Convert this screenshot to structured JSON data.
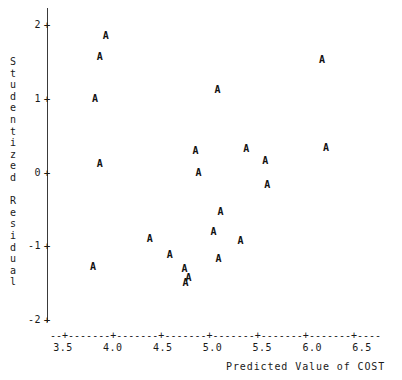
{
  "chart_data": {
    "type": "scatter",
    "title": "",
    "xlabel": "Predicted Value of COST",
    "ylabel": "Studentized Residual",
    "marker_symbol": "A",
    "xlim": [
      3.4,
      6.8
    ],
    "ylim": [
      -2,
      2.15
    ],
    "xticks": [
      3.5,
      4.0,
      4.5,
      5.0,
      5.5,
      6.0,
      6.5
    ],
    "xticklabels": [
      "3.5",
      "4.0",
      "4.5",
      "5.0",
      "5.5",
      "6.0",
      "6.5"
    ],
    "yticks": [
      2,
      1,
      0,
      -1,
      -2
    ],
    "yticklabels": [
      "2",
      "1",
      "0",
      "-1",
      "-2"
    ],
    "grid": false,
    "legend": null,
    "axis_style": "dashed-x-solid-y",
    "points": [
      {
        "x": 3.93,
        "y": 1.85
      },
      {
        "x": 3.87,
        "y": 1.56
      },
      {
        "x": 3.82,
        "y": 0.99
      },
      {
        "x": 3.87,
        "y": 0.11
      },
      {
        "x": 3.8,
        "y": -1.28
      },
      {
        "x": 4.37,
        "y": -0.9
      },
      {
        "x": 4.57,
        "y": -1.12
      },
      {
        "x": 4.72,
        "y": -1.31
      },
      {
        "x": 4.73,
        "y": -1.5
      },
      {
        "x": 4.76,
        "y": -1.43
      },
      {
        "x": 4.83,
        "y": 0.29
      },
      {
        "x": 4.86,
        "y": -0.01
      },
      {
        "x": 5.05,
        "y": 1.12
      },
      {
        "x": 5.01,
        "y": -0.8
      },
      {
        "x": 5.06,
        "y": -1.17
      },
      {
        "x": 5.08,
        "y": -0.54
      },
      {
        "x": 5.28,
        "y": -0.93
      },
      {
        "x": 5.34,
        "y": 0.32
      },
      {
        "x": 5.53,
        "y": 0.16
      },
      {
        "x": 5.55,
        "y": -0.17
      },
      {
        "x": 6.1,
        "y": 1.52
      },
      {
        "x": 6.14,
        "y": 0.33
      }
    ]
  },
  "axes": {
    "y_title_chars": "S\nt\nu\nd\ne\nn\nt\ni\nz\ne\nd\n \nR\ne\ns\ni\nd\nu\na\nl",
    "x_axis_ascii": "--+-------+-------+-------+-------+-------+-------+----",
    "tick_glyph": "+"
  }
}
